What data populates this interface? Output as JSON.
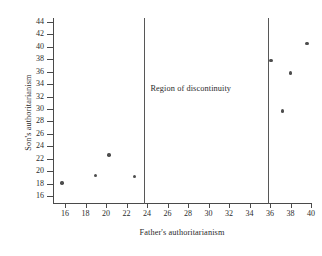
{
  "chart_data": {
    "type": "scatter",
    "title": "",
    "xlabel": "Father's authoritarianism",
    "ylabel": "Son's authoritarianism",
    "xlim": [
      15,
      40.5
    ],
    "ylim": [
      14.8,
      45
    ],
    "xticks": [
      16,
      18,
      20,
      22,
      24,
      26,
      28,
      30,
      32,
      34,
      36,
      38,
      40
    ],
    "yticks": [
      16,
      18,
      20,
      22,
      24,
      26,
      28,
      30,
      32,
      34,
      36,
      38,
      40,
      42,
      44
    ],
    "grid": false,
    "legend": null,
    "points": [
      {
        "x": 15.7,
        "y": 18.1
      },
      {
        "x": 19.0,
        "y": 19.3
      },
      {
        "x": 20.3,
        "y": 22.6
      },
      {
        "x": 22.8,
        "y": 19.1
      },
      {
        "x": 36.1,
        "y": 37.8
      },
      {
        "x": 37.2,
        "y": 29.7
      },
      {
        "x": 38.0,
        "y": 35.8
      },
      {
        "x": 39.6,
        "y": 40.5
      }
    ],
    "annotations": [
      {
        "name": "region-of-discontinuity",
        "text": "Region of discontinuity",
        "x": 29.8,
        "y": 33.2
      }
    ],
    "vertical_lines": [
      {
        "x": 23.7
      },
      {
        "x": 35.8
      }
    ],
    "colors": {
      "point": "#4d4d4d",
      "axis": "#4a4a4a",
      "boundary_line": "#575757",
      "text": "#2b2b2b",
      "background": "#ffffff"
    }
  }
}
